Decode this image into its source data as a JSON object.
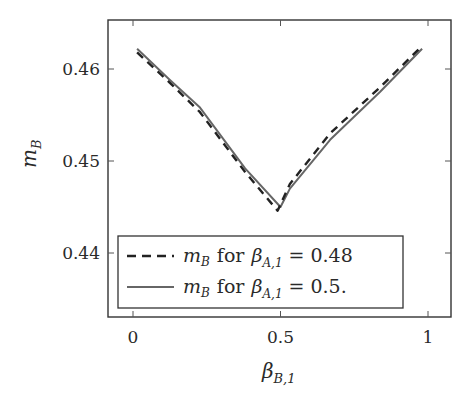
{
  "chart_data": {
    "type": "line",
    "title": "",
    "xlabel": "β_{B,1}",
    "ylabel": "m_B",
    "xlim": [
      -0.08,
      1.08
    ],
    "ylim": [
      0.4332,
      0.4656
    ],
    "xticks": [
      0,
      0.5,
      1
    ],
    "xtick_labels": [
      "0",
      "0.5",
      "1"
    ],
    "yticks": [
      0.44,
      0.45,
      0.46
    ],
    "ytick_labels": [
      "0.44",
      "0.45",
      "0.46"
    ],
    "grid": false,
    "legend_position": "lower center",
    "series": [
      {
        "name": "m_B for β_{A,1} = 0.48",
        "style": "dashed",
        "color": "#222222",
        "x": [
          0.014,
          0.125,
          0.227,
          0.38,
          0.49,
          0.532,
          0.668,
          0.837,
          0.98
        ],
        "y": [
          0.4618,
          0.4585,
          0.4553,
          0.4488,
          0.4446,
          0.4475,
          0.453,
          0.458,
          0.4625
        ]
      },
      {
        "name": "m_B for β_{A,1} = 0.5.",
        "style": "solid",
        "color": "#666666",
        "x": [
          0.014,
          0.125,
          0.227,
          0.38,
          0.5,
          0.532,
          0.668,
          0.837,
          0.98
        ],
        "y": [
          0.4622,
          0.4588,
          0.4558,
          0.4492,
          0.445,
          0.447,
          0.4523,
          0.4575,
          0.4622
        ]
      }
    ]
  },
  "axes": {
    "ylabel_main": "m",
    "ylabel_sub": "B",
    "xlabel_main": "β",
    "xlabel_sub": "B,1"
  },
  "legend": {
    "entries": [
      {
        "var": "m",
        "var_sub": "B",
        "word": "for",
        "param": "β",
        "param_sub": "A,1",
        "eq": "= 0.48"
      },
      {
        "var": "m",
        "var_sub": "B",
        "word": "for",
        "param": "β",
        "param_sub": "A,1",
        "eq": "= 0.5."
      }
    ]
  }
}
